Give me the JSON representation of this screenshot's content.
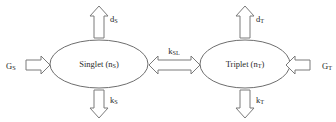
{
  "diagram": {
    "type": "state-rate-diagram",
    "background_color": "#ffffff",
    "stroke_color": "#6e6e6e",
    "text_color": "#1f1f1f",
    "nodes": [
      {
        "id": "singlet",
        "name": "Singlet",
        "population_symbol": "n",
        "population_subscript": "S",
        "label_prefix": "Singlet (n",
        "label_subscript": "S",
        "label_suffix": ")",
        "cx": 99,
        "cy": 64,
        "rx": 49,
        "ry": 24
      },
      {
        "id": "triplet",
        "name": "Triplet",
        "population_symbol": "n",
        "population_subscript": "T",
        "label_prefix": "Triplet (n",
        "label_subscript": "T",
        "label_suffix": ")",
        "cx": 245,
        "cy": 64,
        "rx": 45,
        "ry": 24
      }
    ],
    "arrows": [
      {
        "id": "generation-singlet",
        "symbol": "G",
        "subscript": "S",
        "direction": "right",
        "meaning": "generation rate into singlet",
        "label_x": 6,
        "label_y": 67,
        "label_anchor": "start"
      },
      {
        "id": "generation-triplet",
        "symbol": "G",
        "subscript": "T",
        "direction": "left",
        "meaning": "generation rate into triplet",
        "label_x": 330,
        "label_y": 67,
        "label_anchor": "end"
      },
      {
        "id": "decay-singlet-up",
        "symbol": "d",
        "subscript": "S",
        "direction": "up",
        "meaning": "singlet diffusion/decay out",
        "label_x": 105,
        "label_y": 19,
        "label_anchor": "start"
      },
      {
        "id": "decay-triplet-up",
        "symbol": "d",
        "subscript": "T",
        "direction": "up",
        "meaning": "triplet diffusion/decay out",
        "label_x": 251,
        "label_y": 19,
        "label_anchor": "start"
      },
      {
        "id": "loss-singlet-down",
        "symbol": "k",
        "subscript": "S",
        "direction": "down",
        "meaning": "singlet recombination rate",
        "label_x": 105,
        "label_y": 103,
        "label_anchor": "start"
      },
      {
        "id": "loss-triplet-down",
        "symbol": "k",
        "subscript": "T",
        "direction": "down",
        "meaning": "triplet recombination rate",
        "label_x": 251,
        "label_y": 103,
        "label_anchor": "start"
      },
      {
        "id": "interconversion",
        "symbol": "k",
        "subscript": "SL",
        "direction": "bidirectional-horizontal",
        "meaning": "singlet-triplet interconversion rate",
        "label_x": 174,
        "label_y": 52,
        "label_anchor": "middle"
      }
    ]
  }
}
